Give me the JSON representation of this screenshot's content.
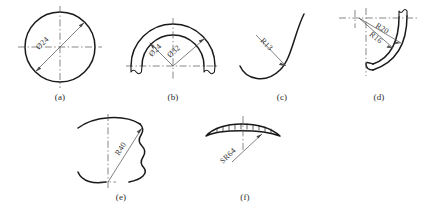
{
  "plate": {
    "caption": "",
    "background": "#ffffff",
    "line_color": "#1a1a1a",
    "center_line_color": "#555555",
    "dimension_color": "#4a4a4a"
  },
  "figures": [
    {
      "id": "a",
      "caption": "(a)",
      "description": "full circle with diameter dimension across center",
      "labels": [
        {
          "text": "Ø24",
          "name": "diameter-24"
        }
      ]
    },
    {
      "id": "b",
      "caption": "(b)",
      "description": "two concentric semicircular arcs with two diameter dimensions",
      "labels": [
        {
          "text": "Ø24",
          "name": "diameter-24"
        },
        {
          "text": "Ø32",
          "name": "diameter-32"
        }
      ]
    },
    {
      "id": "c",
      "caption": "(c)",
      "description": "J shaped curve with leader line radius callout",
      "labels": [
        {
          "text": "R13",
          "name": "radius-13"
        }
      ]
    },
    {
      "id": "d",
      "caption": "(d)",
      "description": "curved hook profile with two radius dimensions from common center",
      "labels": [
        {
          "text": "R20",
          "name": "radius-20"
        },
        {
          "text": "R16",
          "name": "radius-16"
        }
      ]
    },
    {
      "id": "e",
      "caption": "(e)",
      "description": "broken outline part with large radius dimension from lower center",
      "labels": [
        {
          "text": "R40",
          "name": "radius-40"
        }
      ]
    },
    {
      "id": "f",
      "caption": "(f)",
      "description": "thin spherical cap section with spherical radius callout",
      "labels": [
        {
          "text": "SR64",
          "name": "spherical-radius-64"
        }
      ]
    }
  ]
}
